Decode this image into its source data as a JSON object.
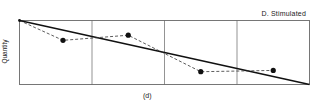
{
  "chart_data": {
    "type": "line",
    "title": "D. Stimulated",
    "xlabel": "(d)",
    "ylabel": "Quantity",
    "grid": {
      "vertical_dividers": 3,
      "horizontal": false
    },
    "panels": 4,
    "series": [
      {
        "name": "trend",
        "style": "solid",
        "color": "#111111",
        "points": [
          [
            0,
            1.0
          ],
          [
            4,
            0.0
          ]
        ]
      },
      {
        "name": "observed",
        "style": "dashed",
        "marker": "filled-circle",
        "color": "#111111",
        "points": [
          [
            0,
            1.0
          ],
          [
            0.6,
            0.69
          ],
          [
            1.5,
            0.77
          ],
          [
            2.5,
            0.2
          ],
          [
            3.5,
            0.22
          ]
        ]
      }
    ],
    "xlim": [
      0,
      4
    ],
    "ylim": [
      0,
      1
    ],
    "legend": {
      "position": "top-right",
      "text": "D. Stimulated"
    }
  },
  "labels": {
    "title": "D. Stimulated",
    "ylabel": "Quantity",
    "caption": "(d)"
  }
}
